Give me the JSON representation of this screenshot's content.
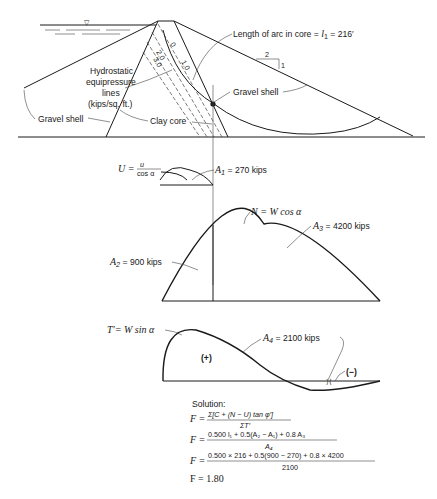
{
  "dam_section": {
    "arc_label": "Length of arc in core = ",
    "arc_symbol": "l",
    "arc_sub": "1",
    "arc_value": " = 216′",
    "slope_run": "2",
    "slope_rise": "1",
    "hydro_label_lines": [
      "Hydrostatic",
      "equipressure",
      "lines",
      "(kips/sq. ft.)"
    ],
    "pressure_values": [
      "0",
      "1.0",
      "2.0",
      "3.0"
    ],
    "gravel_shell_left": "Gravel shell",
    "gravel_shell_right": "Gravel shell",
    "clay_core": "Clay core",
    "water_symbol": "▽"
  },
  "u_diagram": {
    "formula_lhs": "U = ",
    "formula_num": "u",
    "formula_den": "cos α",
    "area_label": "A",
    "area_sub": "1",
    "area_value": " = 270 kips"
  },
  "n_diagram": {
    "formula": "N = W cos α",
    "a2_label": "A",
    "a2_sub": "2",
    "a2_value": " = 900 kips",
    "a3_label": "A",
    "a3_sub": "3",
    "a3_value": " = 4200 kips"
  },
  "t_diagram": {
    "formula": "T′= W sin α",
    "a4_label": "A",
    "a4_sub": "4",
    "a4_value": " = 2100 kips",
    "positive": "(+)",
    "negative": "(−)"
  },
  "solution": {
    "heading": "Solution:",
    "eq1_num": "Σ[C + (N − U) tan φ′]",
    "eq1_den": "ΣT′",
    "eq2_num": "0.500 l₁ + 0.5(A₂ − A₁) + 0.8 A₃",
    "eq2_den": "A₄",
    "eq3_num": "0.500 × 216 + 0.5(900 − 270) + 0.8 × 4200",
    "eq3_den": "2100",
    "result": "F = 1.80",
    "lhs": "F ="
  }
}
